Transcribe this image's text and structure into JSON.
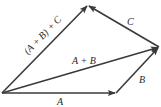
{
  "diagram": {
    "stroke_color": "#3a3a3a",
    "background": "#ffffff",
    "vectors": [
      {
        "id": "A",
        "label": "A",
        "from": [
          2,
          93
        ],
        "to": [
          116,
          93
        ]
      },
      {
        "id": "B",
        "label": "B",
        "from": [
          116,
          93
        ],
        "to": [
          159,
          47
        ]
      },
      {
        "id": "C",
        "label": "C",
        "from": [
          159,
          47
        ],
        "to": [
          88,
          5
        ]
      },
      {
        "id": "AplusB",
        "label": "A + B",
        "from": [
          2,
          93
        ],
        "to": [
          159,
          47
        ]
      },
      {
        "id": "sum",
        "label": "(A + B) + C",
        "from": [
          2,
          93
        ],
        "to": [
          88,
          5
        ]
      }
    ],
    "labels": {
      "A": "A",
      "B": "B",
      "C": "C",
      "AplusB": "A + B",
      "sum": "(A + B) + C"
    }
  }
}
